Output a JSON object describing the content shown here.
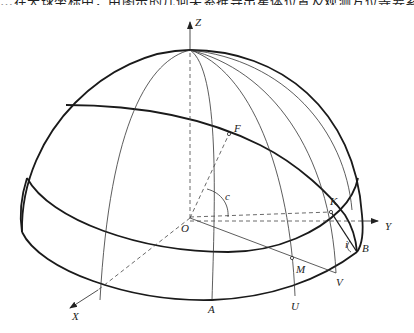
{
  "caption": "…在天球坐标中，由图示的几何关系推导出星体位置及观测方位等要素计算…",
  "figure": {
    "type": "celestial-hemisphere-diagram",
    "axes": {
      "x": "X",
      "y": "Y",
      "z": "Z"
    },
    "points": {
      "origin": "O",
      "F": "F",
      "K": "K",
      "M": "M",
      "V": "V",
      "B": "B",
      "U": "U",
      "A": "A"
    },
    "angles": {
      "c": "c",
      "i": "i"
    }
  }
}
